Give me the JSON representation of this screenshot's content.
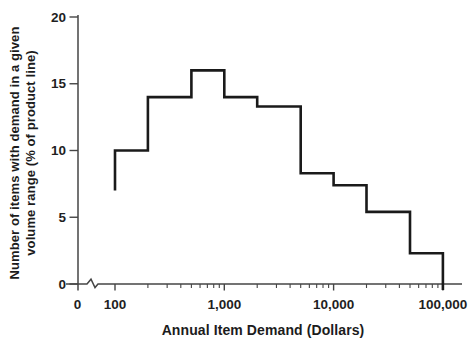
{
  "figure": {
    "background": "#ffffff",
    "step_line_color": "#1a1a1a",
    "axis_color": "#454545",
    "label_color": "#1f1f1f"
  },
  "chart_data": {
    "type": "line",
    "subtype": "step-histogram",
    "title": "",
    "xlabel": "Annual Item Demand (Dollars)",
    "ylabel": "Number of items with demand in a given volume range (% of product line)",
    "ylabel_lines": [
      "Number of items with demand in a given",
      "volume range (% of product line)"
    ],
    "x_scale": "log10",
    "x_axis_break_after_zero": true,
    "xlim": [
      100,
      100000
    ],
    "ylim": [
      0,
      20
    ],
    "grid": false,
    "legend": false,
    "x_tick_labels": [
      {
        "value": 0,
        "label": "0"
      },
      {
        "value": 100,
        "label": "100"
      },
      {
        "value": 1000,
        "label": "1,000"
      },
      {
        "value": 10000,
        "label": "10,000"
      },
      {
        "value": 100000,
        "label": "100,000"
      }
    ],
    "x_minor_tick_multiples": [
      2,
      3,
      4,
      5,
      6,
      7,
      8,
      9
    ],
    "y_ticks": [
      {
        "value": 0,
        "label": "0"
      },
      {
        "value": 5,
        "label": "5"
      },
      {
        "value": 10,
        "label": "10"
      },
      {
        "value": 15,
        "label": "15"
      },
      {
        "value": 20,
        "label": "20"
      }
    ],
    "series": [
      {
        "name": "percent-of-items-by-annual-demand",
        "start": {
          "x": 100,
          "y": 7
        },
        "bins": [
          {
            "from": 100,
            "to": 200,
            "value": 10
          },
          {
            "from": 200,
            "to": 500,
            "value": 14
          },
          {
            "from": 500,
            "to": 1000,
            "value": 16
          },
          {
            "from": 1000,
            "to": 2000,
            "value": 14
          },
          {
            "from": 2000,
            "to": 5000,
            "value": 13.3
          },
          {
            "from": 5000,
            "to": 10000,
            "value": 8.3
          },
          {
            "from": 10000,
            "to": 20000,
            "value": 7.4
          },
          {
            "from": 20000,
            "to": 50000,
            "value": 5.4
          },
          {
            "from": 50000,
            "to": 100000,
            "value": 2.3
          }
        ],
        "end": {
          "x": 100000,
          "y": 0
        }
      }
    ]
  }
}
